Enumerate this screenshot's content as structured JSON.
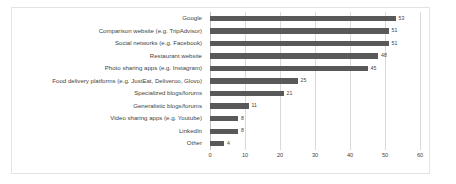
{
  "chart_data": {
    "type": "bar",
    "orientation": "horizontal",
    "title": "",
    "subtitle": "",
    "xlabel": "",
    "ylabel": "",
    "xlim": [
      0,
      60
    ],
    "xticks": [
      0,
      10,
      20,
      30,
      40,
      50,
      60
    ],
    "grid": true,
    "legend": false,
    "bar_color": "#595959",
    "gridline_color": "#d9d9d9",
    "label_color": "#3f3f3f",
    "categories": [
      "Google",
      "Comparison website (e.g. TripAdvisor)",
      "Social networks (e.g. Facebook)",
      "Restaurant website",
      "Photo sharing apps (e.g. Instagram)",
      "Food delivery platforms (e.g. JustEat, Deliveroo, Glovo)",
      "Specialized blogs/forums",
      "Generalistic blogs/forums",
      "Video sharing apps (e.g. Youtube)",
      "LinkedIn",
      "Other"
    ],
    "values": [
      53,
      51,
      51,
      48,
      45,
      25,
      21,
      11,
      8,
      8,
      4
    ],
    "data_labels": [
      "53",
      "51",
      "51",
      "48",
      "45",
      "25",
      "21",
      "11",
      "8",
      "8",
      "4"
    ],
    "tick_labels": [
      "0",
      "10",
      "20",
      "30",
      "40",
      "50",
      "60"
    ]
  }
}
